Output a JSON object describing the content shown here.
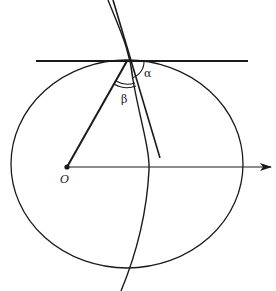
{
  "diagram": {
    "type": "geometry",
    "labels": {
      "origin": "O",
      "alpha": "α",
      "beta": "β"
    },
    "colors": {
      "stroke": "#1a1a1a",
      "background": "#ffffff"
    },
    "geometry": {
      "ellipse": {
        "cx": 127,
        "cy": 164,
        "rx": 116,
        "ry": 104
      },
      "origin_point": {
        "x": 67,
        "y": 167
      },
      "contact_point": {
        "x": 127,
        "y": 61
      },
      "tangent_line": {
        "x1": 36,
        "y1": 61,
        "x2": 248,
        "y2": 61
      },
      "axis_arrow": {
        "x1": 67,
        "y1": 167,
        "x2": 271,
        "y2": 167
      },
      "radius_line": {
        "x1": 67,
        "y1": 167,
        "x2": 127,
        "y2": 61
      },
      "straight_line": {
        "x1": 113,
        "y1": 0,
        "x2": 160,
        "y2": 158
      }
    }
  }
}
